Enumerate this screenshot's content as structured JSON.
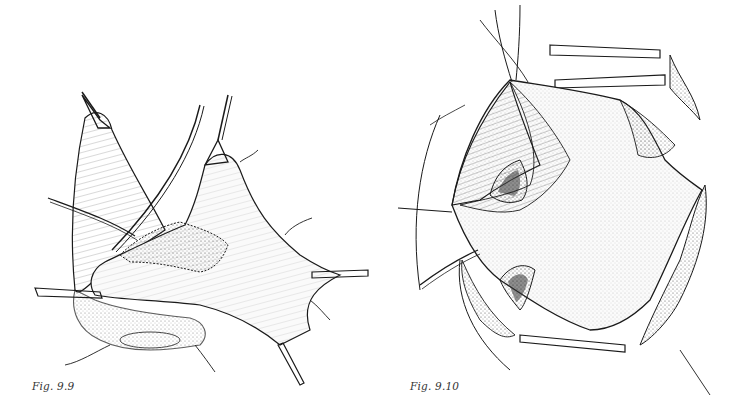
{
  "figures": [
    {
      "id": "left",
      "caption": "Fig. 9.9",
      "subject": "surgical-illustration-tissue-flap-with-clamps-and-sutures"
    },
    {
      "id": "right",
      "caption": "Fig. 9.10",
      "subject": "surgical-illustration-open-cavity-with-retractors"
    }
  ],
  "colors": {
    "ink": "#1a1a1a",
    "paper": "#ffffff"
  }
}
